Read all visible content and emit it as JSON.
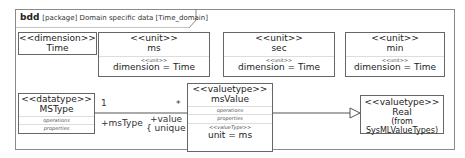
{
  "diagram": {
    "kind": "bdd",
    "header": "[package] Domain specific data [Time_domain]"
  },
  "blocks": {
    "time": {
      "stereotype": "<<dimension>>",
      "name": "Time"
    },
    "ms": {
      "stereotype": "<<unit>>",
      "name": "ms",
      "compartment_stereotype": "<<unit>>",
      "attribute": "dimension = Time"
    },
    "sec": {
      "stereotype": "<<unit>>",
      "name": "sec",
      "compartment_stereotype": "<<unit>>",
      "attribute": "dimension = Time"
    },
    "min": {
      "stereotype": "<<unit>>",
      "name": "min",
      "compartment_stereotype": "<<unit>>",
      "attribute": "dimension = Time"
    },
    "mstype": {
      "stereotype": "<<datatype>>",
      "name": "MSType",
      "compartments": [
        "operations",
        "properties"
      ]
    },
    "msvalue": {
      "stereotype": "<<valuetype>>",
      "name": "msValue",
      "compartments": [
        "operations",
        "properties"
      ],
      "compartment_stereotype": "<<valueType>>",
      "attribute": "unit = ms"
    },
    "real": {
      "stereotype": "<<valuetype>>",
      "name": "Real",
      "origin": "(from SysMLValueTypes)"
    }
  },
  "association": {
    "source_multiplicity": "1",
    "target_multiplicity": "*",
    "source_role": "+msType",
    "target_role": "+value",
    "target_constraint": "{ unique }"
  },
  "generalization": {
    "from": "msValue",
    "to": "Real"
  }
}
